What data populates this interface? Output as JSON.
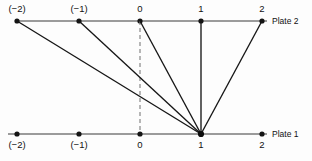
{
  "figure": {
    "title": "",
    "background_color": "#fdfdfd",
    "line_color": "#1a1a1a",
    "text_color": "#111111",
    "width": 312,
    "height": 161
  },
  "plates": [
    {
      "id": "plate-2",
      "name": "Plate 2",
      "label": "Plate 2",
      "label_x": 272,
      "label_y": 16,
      "axis_y": 21,
      "axis_x_start": 17,
      "axis_x_end": 267,
      "label_position": "above",
      "ticks": [
        {
          "label": "(−2)",
          "value": -2,
          "x": 17,
          "label_y": 4
        },
        {
          "label": "(−1)",
          "value": -1,
          "x": 79,
          "label_y": 4
        },
        {
          "label": "0",
          "value": 0,
          "x": 140,
          "label_y": 4
        },
        {
          "label": "1",
          "value": 1,
          "x": 201,
          "label_y": 4
        },
        {
          "label": "2",
          "value": 2,
          "x": 262,
          "label_y": 4
        }
      ]
    },
    {
      "id": "plate-1",
      "name": "Plate 1",
      "label": "Plate 1",
      "label_x": 272,
      "label_y": 129,
      "axis_y": 134,
      "axis_x_start": 8,
      "axis_x_end": 267,
      "label_position": "below",
      "ticks": [
        {
          "label": "(−2)",
          "value": -2,
          "x": 17,
          "label_y": 140
        },
        {
          "label": "(−1)",
          "value": -1,
          "x": 79,
          "label_y": 140
        },
        {
          "label": "0",
          "value": 0,
          "x": 140,
          "label_y": 140
        },
        {
          "label": "1",
          "value": 1,
          "x": 201,
          "label_y": 140
        },
        {
          "label": "2",
          "value": 2,
          "x": 262,
          "label_y": 140
        }
      ]
    }
  ],
  "convergence_point": {
    "x": 201,
    "y": 134,
    "plate": "Plate 1",
    "value": 1
  },
  "paths": [
    {
      "name": "path-from-minus-2",
      "from_value": -2,
      "x1": 17,
      "y1": 21,
      "x2": 201,
      "y2": 134
    },
    {
      "name": "path-from-minus-1",
      "from_value": -1,
      "x1": 79,
      "y1": 21,
      "x2": 201,
      "y2": 134
    },
    {
      "name": "path-from-0",
      "from_value": 0,
      "x1": 140,
      "y1": 21,
      "x2": 201,
      "y2": 134
    },
    {
      "name": "path-from-1",
      "from_value": 1,
      "x1": 201,
      "y1": 21,
      "x2": 201,
      "y2": 134
    },
    {
      "name": "path-from-2",
      "from_value": 2,
      "x1": 262,
      "y1": 21,
      "x2": 201,
      "y2": 134
    }
  ],
  "reference_line": {
    "name": "dashed-reference-line",
    "style": "dashed",
    "x1": 140,
    "y1": 21,
    "x2": 140,
    "y2": 134,
    "dash_pattern": "4,3"
  }
}
